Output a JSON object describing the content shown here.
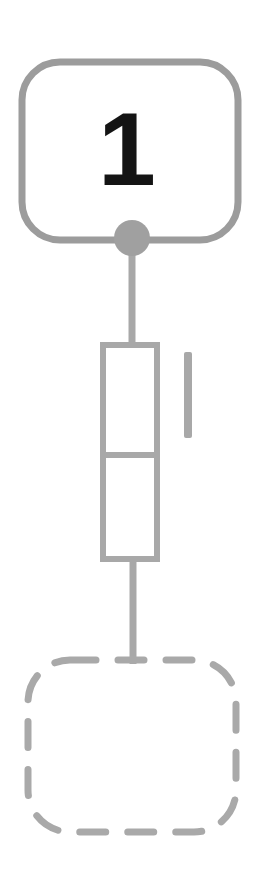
{
  "canvas": {
    "width": 260,
    "height": 896,
    "background": "#ffffff"
  },
  "theme": {
    "stroke_color": "#9c9c9c",
    "stroke_color_light": "#a8a8a8",
    "node_fill": "#ffffff",
    "connector_fill": "#a0a0a0",
    "number_color": "#141414",
    "dashed_stroke_color": "#a9a9a9"
  },
  "diagram": {
    "type": "schematic-flow",
    "orientation": "vertical",
    "title": "",
    "elements": [
      {
        "id": "block-1",
        "kind": "rounded-rectangle",
        "name": "numbered-block",
        "label": "1",
        "style": "solid",
        "x": 22,
        "y": 62,
        "width": 216,
        "height": 178,
        "corner_radius": 38,
        "stroke_width": 7,
        "stroke": "#9c9c9c",
        "fill": "#ffffff"
      },
      {
        "id": "port-1",
        "kind": "circle",
        "name": "connector-node",
        "label": "",
        "cx": 132,
        "cy": 238,
        "r": 18,
        "fill": "#a0a0a0",
        "stroke": "none"
      },
      {
        "id": "wire-1",
        "kind": "line",
        "name": "connector-line-upper",
        "x1": 132,
        "y1": 252,
        "x2": 132,
        "y2": 344,
        "stroke_width": 7,
        "stroke": "#a8a8a8"
      },
      {
        "id": "stack-box",
        "kind": "rectangle-split",
        "name": "stacked-component",
        "x": 100,
        "y": 342,
        "width": 60,
        "height": 220,
        "divider_y": 455,
        "stroke_width": 6,
        "stroke": "#a8a8a8",
        "fill": "#ffffff",
        "segments": 2
      },
      {
        "id": "tick-mark",
        "kind": "vertical-bar",
        "name": "tick-marker",
        "x": 184,
        "y": 352,
        "width": 8,
        "height": 86,
        "fill": "#a8a8a8"
      },
      {
        "id": "wire-2",
        "kind": "line",
        "name": "connector-line-lower",
        "x1": 133,
        "y1": 560,
        "x2": 133,
        "y2": 662,
        "stroke_width": 7,
        "stroke": "#a8a8a8"
      },
      {
        "id": "block-2",
        "kind": "rounded-rectangle",
        "name": "placeholder-block",
        "label": "",
        "style": "dashed",
        "x": 28,
        "y": 660,
        "width": 208,
        "height": 172,
        "corner_radius": 42,
        "stroke_width": 7,
        "stroke": "#a9a9a9",
        "fill": "#ffffff",
        "dash_pattern": "26 22"
      }
    ]
  },
  "labels": {
    "block_one_number": "1"
  }
}
